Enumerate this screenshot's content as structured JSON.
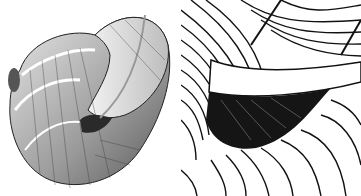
{
  "figure": {
    "panels": [
      {
        "id": "left",
        "description": "Engraving of a coiled snail shell showing spiral whorls with banding lines"
      },
      {
        "id": "right",
        "description": "Close-up engraving detail of shell aperture with dense hatched lines"
      }
    ],
    "colors": {
      "ink": "#1a1a1a",
      "paper": "#ffffff",
      "shade": "#8a8a8a"
    }
  }
}
